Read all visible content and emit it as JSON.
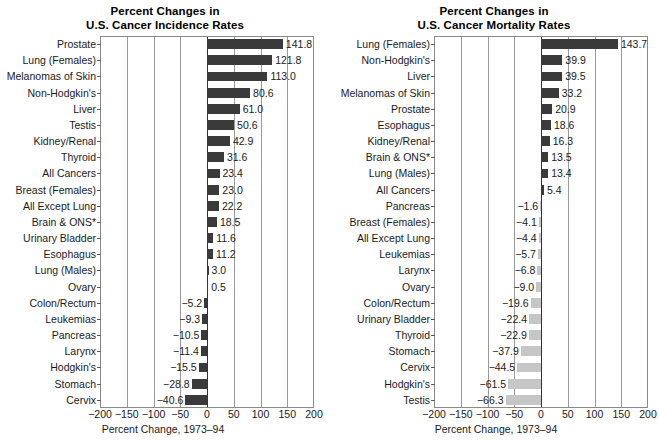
{
  "chart_data": [
    {
      "type": "bar",
      "orientation": "horizontal",
      "title": "Percent Changes in U.S. Cancer Incidence Rates",
      "title_line1": "Percent Changes in",
      "title_line2": "U.S. Cancer Incidence Rates",
      "xlabel": "Percent Change, 1973–94",
      "ylabel": "",
      "xlim": [
        -200,
        200
      ],
      "xticks": [
        -200,
        -150,
        -100,
        -50,
        0,
        50,
        100,
        150,
        200
      ],
      "xticklabels": [
        "−200",
        "−150",
        "−100",
        "−50",
        "0",
        "50",
        "100",
        "150",
        "200"
      ],
      "grid": true,
      "legend": "none",
      "bar_color": "#3a3a3a",
      "categories": [
        "Prostate",
        "Lung (Females)",
        "Melanomas of Skin",
        "Non-Hodgkin's",
        "Liver",
        "Testis",
        "Kidney/Renal",
        "Thyroid",
        "All Cancers",
        "Breast (Females)",
        "All Except Lung",
        "Brain & ONS*",
        "Urinary Bladder",
        "Esophagus",
        "Lung (Males)",
        "Ovary",
        "Colon/Rectum",
        "Leukemias",
        "Pancreas",
        "Larynx",
        "Hodgkin's",
        "Stomach",
        "Cervix"
      ],
      "values": [
        141.8,
        121.8,
        113.0,
        80.6,
        61.0,
        50.6,
        42.9,
        31.6,
        23.4,
        23.0,
        22.2,
        18.5,
        11.6,
        11.2,
        3.0,
        0.5,
        -5.2,
        -9.3,
        -10.5,
        -11.4,
        -15.5,
        -28.8,
        -40.6
      ],
      "value_labels": [
        "141.8",
        "121.8",
        "113.0",
        "80.6",
        "61.0",
        "50.6",
        "42.9",
        "31.6",
        "23.4",
        "23.0",
        "22.2",
        "18.5",
        "11.6",
        "11.2",
        "3.0",
        "0.5",
        "−5.2",
        "−9.3",
        "−10.5",
        "−11.4",
        "−15.5",
        "−28.8",
        "−40.6"
      ]
    },
    {
      "type": "bar",
      "orientation": "horizontal",
      "title": "Percent Changes in U.S. Cancer Mortality Rates",
      "title_line1": "Percent Changes in",
      "title_line2": "U.S. Cancer Mortality Rates",
      "xlabel": "Percent Change, 1973–94",
      "ylabel": "",
      "xlim": [
        -200,
        200
      ],
      "xticks": [
        -200,
        -150,
        -100,
        -50,
        0,
        50,
        100,
        150,
        200
      ],
      "xticklabels": [
        "−200",
        "−150",
        "−100",
        "−50",
        "0",
        "50",
        "100",
        "150",
        "200"
      ],
      "grid": true,
      "legend": "none",
      "bar_color_positive": "#3a3a3a",
      "bar_color_negative": "#c6c6c6",
      "categories": [
        "Lung (Females)",
        "Non-Hodgkin's",
        "Liver",
        "Melanomas of Skin",
        "Prostate",
        "Esophagus",
        "Kidney/Renal",
        "Brain & ONS*",
        "Lung (Males)",
        "All Cancers",
        "Pancreas",
        "Breast (Females)",
        "All Except Lung",
        "Leukemias",
        "Larynx",
        "Ovary",
        "Colon/Rectum",
        "Urinary Bladder",
        "Thyroid",
        "Stomach",
        "Cervix",
        "Hodgkin's",
        "Testis"
      ],
      "values": [
        143.7,
        39.9,
        39.5,
        33.2,
        20.9,
        18.6,
        16.3,
        13.5,
        13.4,
        5.4,
        -1.6,
        -4.1,
        -4.4,
        -5.7,
        -6.8,
        -9.0,
        -19.6,
        -22.4,
        -22.9,
        -37.9,
        -44.5,
        -61.5,
        -66.3
      ],
      "value_labels": [
        "143.7",
        "39.9",
        "39.5",
        "33.2",
        "20.9",
        "18.6",
        "16.3",
        "13.5",
        "13.4",
        "5.4",
        "−1.6",
        "−4.1",
        "−4.4",
        "−5.7",
        "−6.8",
        "−9.0",
        "−19.6",
        "−22.4",
        "−22.9",
        "−37.9",
        "−44.5",
        "−61.5",
        "−66.3"
      ]
    }
  ]
}
